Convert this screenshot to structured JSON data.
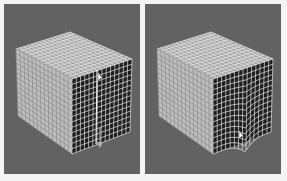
{
  "figure": {
    "panels": [
      {
        "id": "left",
        "description": "subdivided cube mesh, edge loop selected on front-right face",
        "grid_divisions": 14,
        "cursor": {
          "x": 98,
          "y": 72
        },
        "drag_arrow": {
          "x": 100,
          "y": 145,
          "direction": "down"
        }
      },
      {
        "id": "right",
        "description": "subdivided cube mesh, front-right face edge dragged downward causing deformation",
        "grid_divisions": 14,
        "cursor": {
          "x": 98,
          "y": 130
        }
      }
    ],
    "colors": {
      "viewport_bg": "#626262",
      "page_bg": "#f4f4f4",
      "cube_left_face": "#bdbdbd",
      "cube_top_face": "#a8a8a8",
      "cube_right_face": "#1e1e1e",
      "wire_light": "#e8e8e8",
      "wire_dark": "#8a8a8a"
    }
  }
}
